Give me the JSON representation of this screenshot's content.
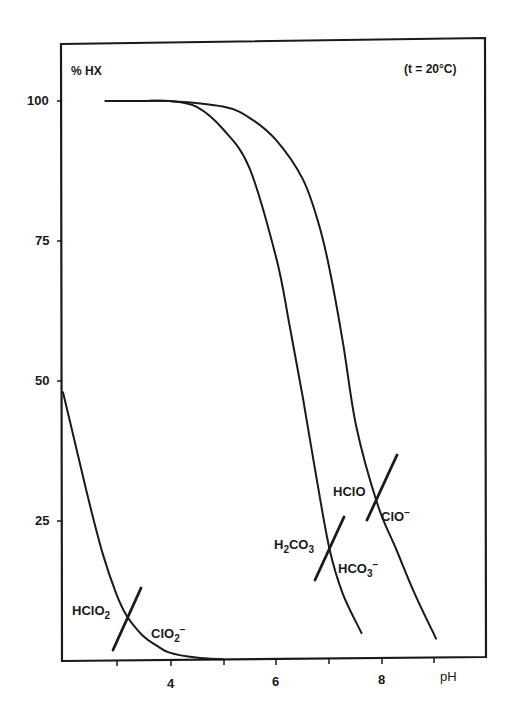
{
  "chart_data": {
    "type": "line",
    "title": "",
    "annotation_top_right": "(t = 20°C)",
    "ylabel": "% HX",
    "xlabel": "pH",
    "xlim": [
      2,
      9.4
    ],
    "ylim": [
      0,
      108
    ],
    "grid": false,
    "x_ticks": [
      3,
      4,
      5,
      6,
      7,
      8,
      9
    ],
    "x_tick_labels": [
      "",
      "4",
      "",
      "6",
      "",
      "8",
      ""
    ],
    "y_ticks": [
      25,
      50,
      75,
      100
    ],
    "y_tick_labels": [
      "25",
      "50",
      "75",
      "100"
    ],
    "series": [
      {
        "name": "HClO2 / ClO2-",
        "pKa_marker_pH": 3.2,
        "x": [
          2.0,
          2.25,
          2.5,
          2.75,
          3.0,
          3.2,
          3.5,
          3.75,
          4.0,
          4.5,
          5.0
        ],
        "y": [
          48,
          38,
          28,
          19,
          12,
          8,
          4.5,
          2.8,
          1.5,
          0.6,
          0.3
        ],
        "labels": {
          "acid": "HClO2",
          "base": "ClO2-"
        }
      },
      {
        "name": "H2CO3 / HCO3-",
        "pKa_marker_pH": 7.0,
        "x": [
          2.8,
          3.5,
          4.0,
          4.5,
          5.0,
          5.5,
          6.0,
          6.25,
          6.5,
          6.75,
          7.0,
          7.25,
          7.6
        ],
        "y": [
          100,
          100,
          100,
          99,
          95,
          88,
          72,
          60,
          47,
          33,
          20,
          12,
          5
        ],
        "labels": {
          "acid": "H2CO3",
          "base": "HCO3-"
        }
      },
      {
        "name": "HClO / ClO-",
        "pKa_marker_pH": 7.9,
        "x": [
          2.8,
          3.5,
          4.0,
          5.0,
          5.5,
          6.0,
          6.5,
          6.8,
          7.0,
          7.25,
          7.5,
          7.9,
          8.25,
          8.6,
          9.0
        ],
        "y": [
          100,
          100,
          100,
          99,
          97,
          93,
          86,
          78,
          70,
          57,
          42,
          28,
          20,
          12,
          4
        ],
        "labels": {
          "acid": "HClO",
          "base": "ClO-"
        }
      }
    ]
  },
  "labels": {
    "ylabel": "% HX",
    "xlabel": "pH",
    "temp": "(t = 20°C)",
    "y100": "100",
    "y75": "75",
    "y50": "50",
    "y25": "25",
    "x4": "4",
    "x6": "6",
    "x8": "8",
    "hclo2": "HClO",
    "hclo2_sub": "2",
    "clo2": "ClO",
    "clo2_sub": "2",
    "clo2_sup": "−",
    "h2co3_a": "H",
    "h2co3_sub1": "2",
    "h2co3_b": "CO",
    "h2co3_sub2": "3",
    "hco3": "HCO",
    "hco3_sub": "3",
    "hco3_sup": "−",
    "hclo": "HClO",
    "clo": "ClO",
    "clo_sup": "−"
  }
}
